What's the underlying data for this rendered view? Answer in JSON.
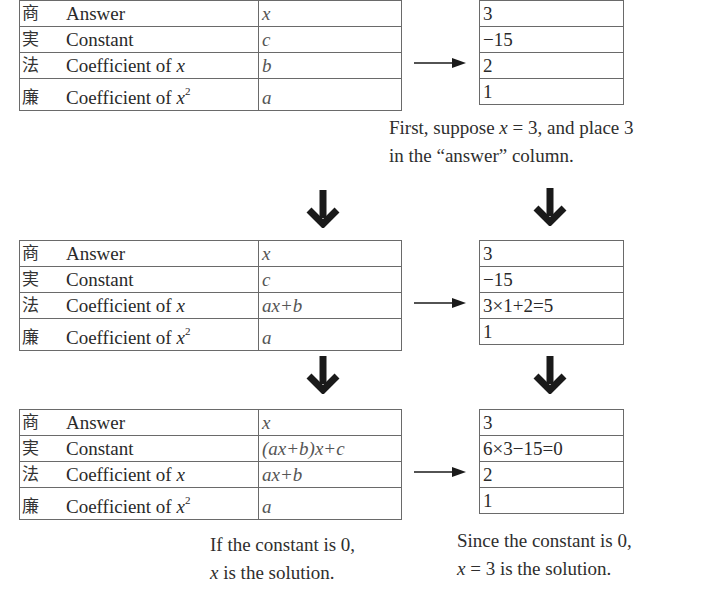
{
  "steps": [
    {
      "left_table": {
        "rows": [
          {
            "kanji": "商",
            "label": "Answer",
            "label_var": "",
            "label_sup": "",
            "value": "x"
          },
          {
            "kanji": "実",
            "label": "Constant",
            "label_var": "",
            "label_sup": "",
            "value": "c"
          },
          {
            "kanji": "法",
            "label": "Coefficient of ",
            "label_var": "x",
            "label_sup": "",
            "value": "b"
          },
          {
            "kanji": "廉",
            "label": "Coefficient of ",
            "label_var": "x",
            "label_sup": "2",
            "value": "a"
          }
        ]
      },
      "right_table": {
        "rows": [
          "3",
          "−15",
          "2",
          "1"
        ]
      },
      "caption": {
        "line1_pre": "First, suppose ",
        "line1_var": "x",
        "line1_post": " = 3, and place 3",
        "line2": "in the “answer” column."
      }
    },
    {
      "left_table": {
        "rows": [
          {
            "kanji": "商",
            "label": "Answer",
            "label_var": "",
            "label_sup": "",
            "value": "x"
          },
          {
            "kanji": "実",
            "label": "Constant",
            "label_var": "",
            "label_sup": "",
            "value": "c"
          },
          {
            "kanji": "法",
            "label": "Coefficient of ",
            "label_var": "x",
            "label_sup": "",
            "value": "ax+b"
          },
          {
            "kanji": "廉",
            "label": "Coefficient of ",
            "label_var": "x",
            "label_sup": "2",
            "value": "a"
          }
        ]
      },
      "right_table": {
        "rows": [
          "3",
          "−15",
          "3×1+2=5",
          "1"
        ]
      }
    },
    {
      "left_table": {
        "rows": [
          {
            "kanji": "商",
            "label": "Answer",
            "label_var": "",
            "label_sup": "",
            "value": "x"
          },
          {
            "kanji": "実",
            "label": "Constant",
            "label_var": "",
            "label_sup": "",
            "value": "(ax+b)x+c"
          },
          {
            "kanji": "法",
            "label": "Coefficient of ",
            "label_var": "x",
            "label_sup": "",
            "value": "ax+b"
          },
          {
            "kanji": "廉",
            "label": "Coefficient of ",
            "label_var": "x",
            "label_sup": "2",
            "value": "a"
          }
        ]
      },
      "right_table": {
        "rows": [
          "3",
          "6×3−15=0",
          "2",
          "1"
        ]
      },
      "left_caption": {
        "line1": "If the constant is 0,",
        "line2_var": "x",
        "line2_post": " is the solution."
      },
      "right_caption": {
        "line1": "Since the constant is 0,",
        "line2_var": "x",
        "line2_post": " = 3 is the solution."
      }
    }
  ],
  "icons": {
    "right_arrow": "right-arrow-icon",
    "down_arrow": "thick-down-arrow-icon"
  },
  "colors": {
    "border": "#6a6a6a",
    "text": "#2a2a2a",
    "arrow": "#1a1a1a"
  }
}
